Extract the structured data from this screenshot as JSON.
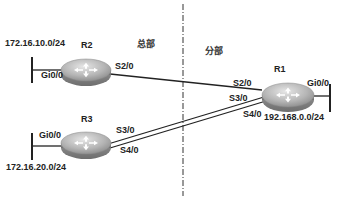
{
  "diagram": {
    "zones": [
      {
        "id": "headquarters",
        "label": "总部"
      },
      {
        "id": "branch",
        "label": "分部"
      }
    ],
    "routers": [
      {
        "id": "R1",
        "label": "R1"
      },
      {
        "id": "R2",
        "label": "R2"
      },
      {
        "id": "R3",
        "label": "R3"
      }
    ],
    "networks": {
      "r2_lan": "172.16.10.0/24",
      "r3_lan": "172.16.20.0/24",
      "r1_lan": "192.168.0.0/24"
    },
    "interfaces": {
      "r2_gi": "Gi0/0",
      "r2_s": "S2/0",
      "r3_gi": "Gi0/0",
      "r3_s3": "S3/0",
      "r3_s4": "S4/0",
      "r1_gi": "Gi0/0",
      "r1_s2": "S2/0",
      "r1_s3": "S3/0",
      "r1_s4": "S4/0"
    },
    "links": [
      {
        "from": "R2:S2/0",
        "to": "R1:S2/0"
      },
      {
        "from": "R3:S3/0",
        "to": "R1:S3/0"
      },
      {
        "from": "R3:S4/0",
        "to": "R1:S4/0"
      }
    ],
    "divider": "dash-dot vertical line separating 总部 and 分部"
  }
}
